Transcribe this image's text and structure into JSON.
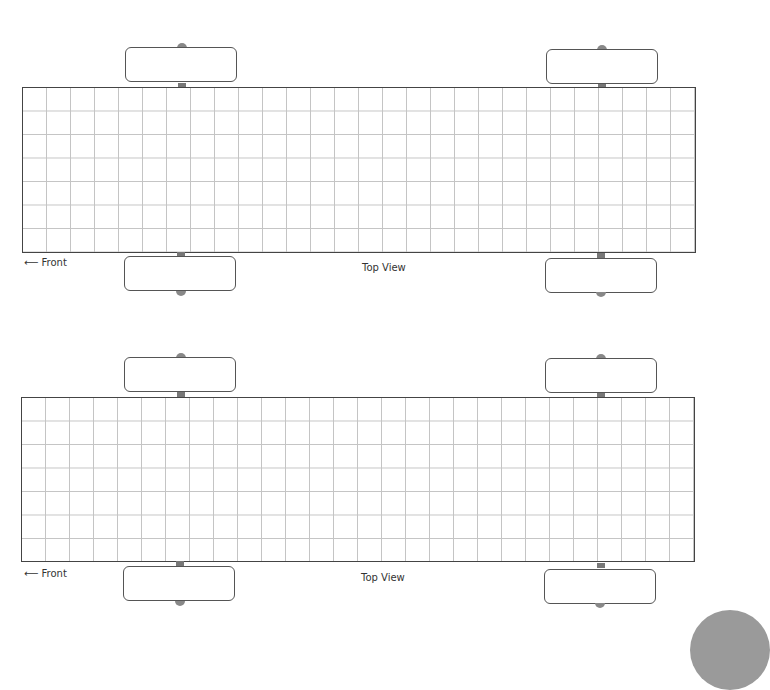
{
  "templates": [
    {
      "front_label": "⟵ Front",
      "view_label": "Top View",
      "grid": {
        "columns": 28,
        "rows": 7
      }
    },
    {
      "front_label": "⟵ Front",
      "view_label": "Top View",
      "grid": {
        "columns": 28,
        "rows": 7
      }
    }
  ],
  "colors": {
    "outline": "#444444",
    "gridline": "#c4c4c4",
    "axle": "#777777"
  }
}
